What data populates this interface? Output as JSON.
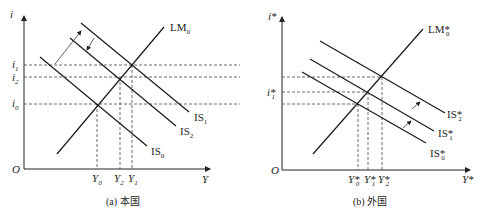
{
  "panel_a": {
    "caption": "(a) 本国",
    "y_axis_label": "i",
    "x_axis_label": "Y",
    "origin": "O",
    "curves": {
      "lm": {
        "name": "LM",
        "sub": "0"
      },
      "is0": {
        "name": "IS",
        "sub": "0"
      },
      "is1": {
        "name": "IS",
        "sub": "1"
      },
      "is2": {
        "name": "IS",
        "sub": "2"
      }
    },
    "y_ticks": [
      {
        "name": "i",
        "sub": "1"
      },
      {
        "name": "i",
        "sub": "2"
      },
      {
        "name": "i",
        "sub": "0"
      }
    ],
    "x_ticks": [
      {
        "name": "Y",
        "sub": "0"
      },
      {
        "name": "Y",
        "sub": "2"
      },
      {
        "name": "Y",
        "sub": "1"
      }
    ]
  },
  "panel_b": {
    "caption": "(b) 外国",
    "y_axis_label": "i*",
    "x_axis_label": "Y*",
    "origin": "O",
    "curves": {
      "lm": {
        "name": "LM*",
        "sub": "0"
      },
      "is0": {
        "name": "IS*",
        "sub": "0"
      },
      "is1": {
        "name": "IS*",
        "sub": "1"
      },
      "is2": {
        "name": "IS*",
        "sub": "2"
      }
    },
    "y_ticks": [
      {
        "name": "i*",
        "sub": "1"
      }
    ],
    "x_ticks": [
      {
        "name": "Y*",
        "sub": "0"
      },
      {
        "name": "Y*",
        "sub": "1"
      },
      {
        "name": "Y*",
        "sub": "2"
      }
    ]
  }
}
